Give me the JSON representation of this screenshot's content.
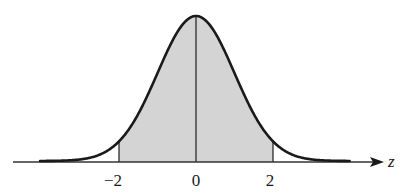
{
  "chart_data": {
    "type": "area",
    "title": "",
    "subtitle": "Standard normal distribution with shaded area between z = -2 and z = 2",
    "xlabel": "z",
    "ylabel": "",
    "xlim": [
      -4.1,
      4.0
    ],
    "ylim": [
      0,
      0.4
    ],
    "grid": false,
    "legend": null,
    "curve": {
      "name": "standard normal density",
      "mean": 0,
      "sd": 1,
      "x": [
        -4,
        -3.5,
        -3,
        -2.5,
        -2,
        -1.5,
        -1,
        -0.5,
        0,
        0.5,
        1,
        1.5,
        2,
        2.5,
        3,
        3.5,
        4
      ],
      "y": [
        0.0001,
        0.0009,
        0.0044,
        0.0175,
        0.054,
        0.1295,
        0.242,
        0.3521,
        0.3989,
        0.3521,
        0.242,
        0.1295,
        0.054,
        0.0175,
        0.0044,
        0.0009,
        0.0001
      ]
    },
    "shaded_region": {
      "from": -2,
      "to": 2,
      "color": "#d4d4d4"
    },
    "vertical_lines": [
      -2,
      0,
      2
    ],
    "x_ticks": [
      {
        "value": -2,
        "label": "−2"
      },
      {
        "value": 0,
        "label": "0"
      },
      {
        "value": 2,
        "label": "2"
      }
    ],
    "axis_label": "z",
    "colors": {
      "curve": "#1a1a1a",
      "axis": "#333333",
      "fill": "#d4d4d4",
      "background": "#ffffff"
    }
  }
}
